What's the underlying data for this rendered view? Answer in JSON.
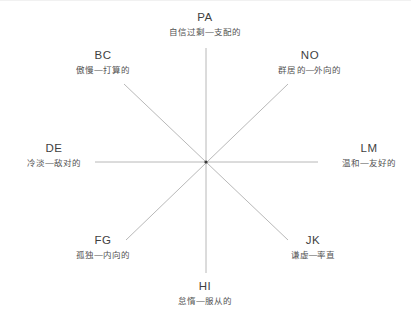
{
  "diagram": {
    "type": "interpersonal-circumplex",
    "background_color": "#ffffff",
    "line_color": "#b0b0b0",
    "text_color": "#4a4a4a",
    "center": {
      "x": 206,
      "y": 162
    },
    "octants": [
      {
        "code": "PA",
        "description": "自信过剩—支配的",
        "position": "top",
        "angle_deg": 90
      },
      {
        "code": "BC",
        "description": "傲慢—打算的",
        "position": "top-left",
        "angle_deg": 135
      },
      {
        "code": "NO",
        "description": "群居的—外向的",
        "position": "top-right",
        "angle_deg": 45
      },
      {
        "code": "DE",
        "description": "冷淡—敌对的",
        "position": "left",
        "angle_deg": 180
      },
      {
        "code": "LM",
        "description": "温和—友好的",
        "position": "right",
        "angle_deg": 0
      },
      {
        "code": "FG",
        "description": "孤独—内向的",
        "position": "bottom-left",
        "angle_deg": 225
      },
      {
        "code": "JK",
        "description": "谦虚—率直",
        "position": "bottom-right",
        "angle_deg": 315
      },
      {
        "code": "HI",
        "description": "怠惰—服从的",
        "position": "bottom",
        "angle_deg": 270
      }
    ]
  }
}
